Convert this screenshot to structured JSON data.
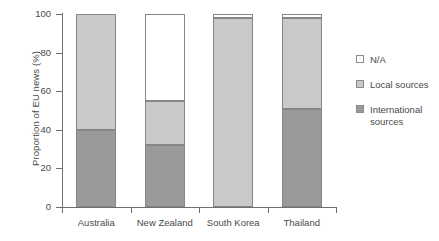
{
  "chart_data": {
    "type": "bar",
    "subtype": "stacked-vertical",
    "title": "",
    "xlabel": "",
    "ylabel": "Proportion of EU news (%)",
    "ylim": [
      0,
      100
    ],
    "yticks": [
      0,
      20,
      40,
      60,
      80,
      100
    ],
    "ytick_labels": [
      "0",
      "20",
      "40",
      "60",
      "80",
      "100"
    ],
    "grid": false,
    "legend_position": "right",
    "categories": [
      "Australia",
      "New Zealand",
      "South Korea",
      "Thailand"
    ],
    "series": [
      {
        "name": "International sources",
        "color": "#9a9a9a",
        "values": [
          40,
          32,
          0,
          51
        ]
      },
      {
        "name": "Local sources",
        "color": "#c9c9c9",
        "values": [
          60,
          23,
          98,
          47
        ]
      },
      {
        "name": "N/A",
        "color": "#ffffff",
        "values": [
          0,
          45,
          2,
          2
        ]
      }
    ],
    "stack_order_bottom_to_top": [
      "International sources",
      "Local sources",
      "N/A"
    ],
    "legend_entries": [
      {
        "label": "N/A",
        "color": "#ffffff"
      },
      {
        "label": "Local sources",
        "color": "#c9c9c9"
      },
      {
        "label": "International sources",
        "color": "#9a9a9a"
      }
    ]
  },
  "axis": {
    "y_title": "Proportion of EU news (%)"
  },
  "legend": {
    "items": [
      {
        "label": "N/A"
      },
      {
        "label": "Local sources"
      },
      {
        "label": "International sources"
      }
    ]
  },
  "colors": {
    "axis": "#6f6f6f",
    "text": "#4a4a4a",
    "na": "#ffffff",
    "local": "#c9c9c9",
    "international": "#9a9a9a",
    "segment_border": "#868686",
    "background": "#ffffff"
  }
}
